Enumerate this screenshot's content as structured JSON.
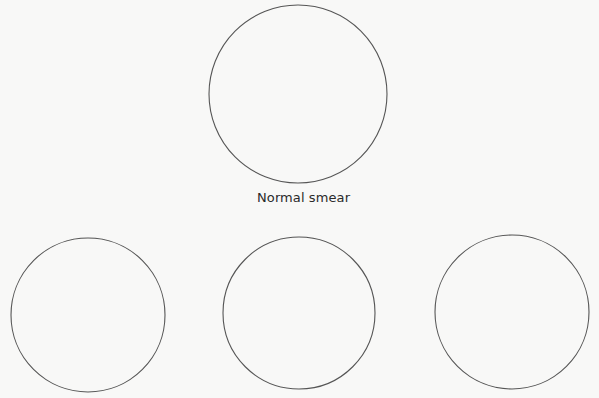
{
  "diagram": {
    "stroke_color": "#555555",
    "background_color": "#f8f8f7",
    "nodes": [
      {
        "id": "normal",
        "label": "Normal smear",
        "cx": 298,
        "cy": 94,
        "r": 89
      },
      {
        "id": "bottom-left",
        "label": "",
        "cx": 88,
        "cy": 315,
        "r": 77
      },
      {
        "id": "bottom-middle",
        "label": "",
        "cx": 299,
        "cy": 313,
        "r": 76
      },
      {
        "id": "bottom-right",
        "label": "",
        "cx": 512,
        "cy": 312,
        "r": 77
      }
    ]
  }
}
